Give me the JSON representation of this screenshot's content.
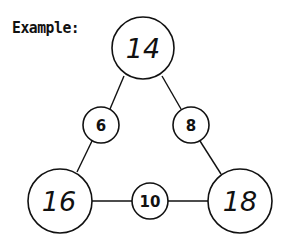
{
  "label": "Example:",
  "colors": {
    "stroke": "#111111",
    "background": "#ffffff"
  },
  "diagram": {
    "type": "triangle-sum-puzzle",
    "corners": {
      "top": "14",
      "bottom_left": "16",
      "bottom_right": "18"
    },
    "edges": {
      "left": "6",
      "right": "8",
      "bottom": "10"
    }
  }
}
